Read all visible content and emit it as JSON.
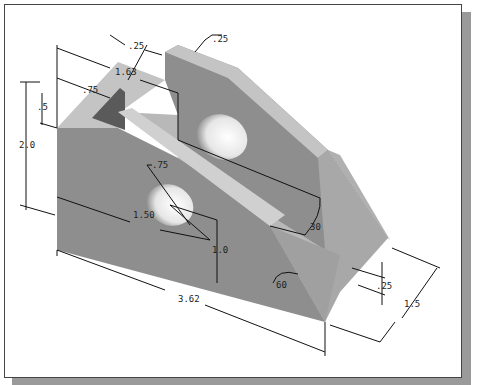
{
  "figure": {
    "type": "isometric-dimensioned-part",
    "colors": {
      "top_face": "#c4c4c4",
      "front_face": "#8e8e8e",
      "side_face": "#a8a8a8",
      "slot_dark": "#5a5a5a",
      "hole_light": "#f2f2f2",
      "frame_shadow": "#9a9a9a"
    },
    "dimensions": {
      "overall_length": "3.62",
      "overall_height": "2.0",
      "depth": "1.5",
      "slot_width": ".25",
      "rib_thickness": ".25",
      "slot_depth_from_top": ".5",
      "slot_offset": ".75",
      "upper_hole_offset": "1.63",
      "lower_hole_dia": ".75",
      "lower_hole_x": "1.50",
      "lower_hole_y": "1.0",
      "base_thickness": ".25",
      "angle_upper": "30",
      "angle_lower": "60"
    }
  }
}
